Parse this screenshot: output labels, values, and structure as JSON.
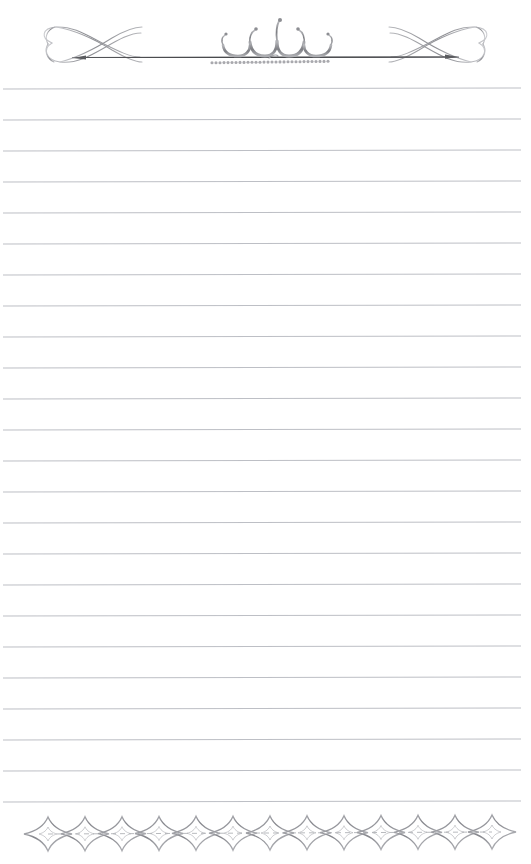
{
  "page": {
    "kind": "decorative-lined-stationery",
    "width": 531,
    "height": 864,
    "background_color": "#ffffff",
    "body_text": "",
    "title_text": ""
  },
  "header": {
    "ornament_name": "crown-and-flourish-divider",
    "rule_color": "#6f6f72",
    "flourish_color": "#9a9a9e",
    "crown_color": "#8d8d92",
    "pearl_color": "#a9a9ae",
    "pearl_count": 30,
    "crown_arch_count": 5
  },
  "lines": {
    "name": "ruled-lines",
    "color": "#b9bcc2",
    "thickness_px": 1,
    "left_px": 3,
    "width_px": 518,
    "first_y_px": 88,
    "spacing_px": 31,
    "count": 24,
    "y_positions": [
      88,
      119,
      150,
      181,
      212,
      243,
      274,
      305,
      336,
      367,
      398,
      429,
      460,
      491,
      522,
      553,
      584,
      615,
      646,
      677,
      708,
      739,
      770,
      801
    ]
  },
  "footer": {
    "ornament_name": "four-point-star-chain-border",
    "description": "Row of concave-sided four pointed stars linked by a dashed centre line",
    "star_color": "#8e9096",
    "dash_color": "#b0b2b7",
    "star_count": 13,
    "start_x_px": 48,
    "spacing_px": 37,
    "center_y_px": 830
  }
}
